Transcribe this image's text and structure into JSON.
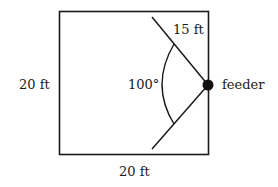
{
  "diagram": {
    "type": "geometry-figure",
    "labels": {
      "side_left": "20 ft",
      "side_bottom": "20 ft",
      "radius": "15 ft",
      "angle": "100°",
      "point": "feeder"
    },
    "square": {
      "side_length": "20 ft"
    },
    "sector": {
      "radius": "15 ft",
      "angle_degrees": 100,
      "center": "feeder"
    },
    "colors": {
      "stroke": "#1a1a1a",
      "background": "#ffffff"
    }
  }
}
